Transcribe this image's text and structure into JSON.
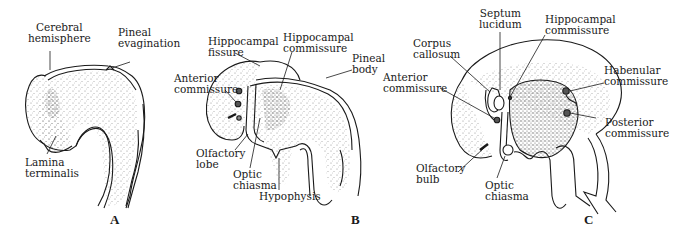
{
  "figure": {
    "panels": [
      {
        "letter": "A",
        "labels": {
          "cerebral_hemisphere": "Cerebral\nhemisphere",
          "pineal_evagination": "Pineal\nevagination",
          "lamina_terminalis": "Lamina\nterminalis"
        }
      },
      {
        "letter": "B",
        "labels": {
          "hippocampal_fissure": "Hippocampal\nfissure",
          "hippocampal_commissure": "Hippocampal\ncommissure",
          "pineal_body": "Pineal\nbody",
          "anterior_commissure": "Anterior\ncommissure",
          "olfactory_lobe": "Olfactory\nlobe",
          "optic_chiasma": "Optic\nchiasma",
          "hypophysis": "Hypophysis"
        }
      },
      {
        "letter": "C",
        "labels": {
          "septum_lucidum": "Septum\nlucidum",
          "hippocampal_commissure": "Hippocampal\ncommissure",
          "corpus_callosum": "Corpus\ncallosum",
          "anterior_commissure": "Anterior\ncommissure",
          "habenular_commissure": "Habenular\ncommissure",
          "posterior_commissure": "Posterior\ncommissure",
          "olfactory_bulb": "Olfactory\nbulb",
          "optic_chiasma": "Optic\nchiasma"
        }
      }
    ],
    "colors": {
      "ink": "#1a1a1a",
      "stipple": "#9a9a9a",
      "background": "#ffffff"
    }
  }
}
